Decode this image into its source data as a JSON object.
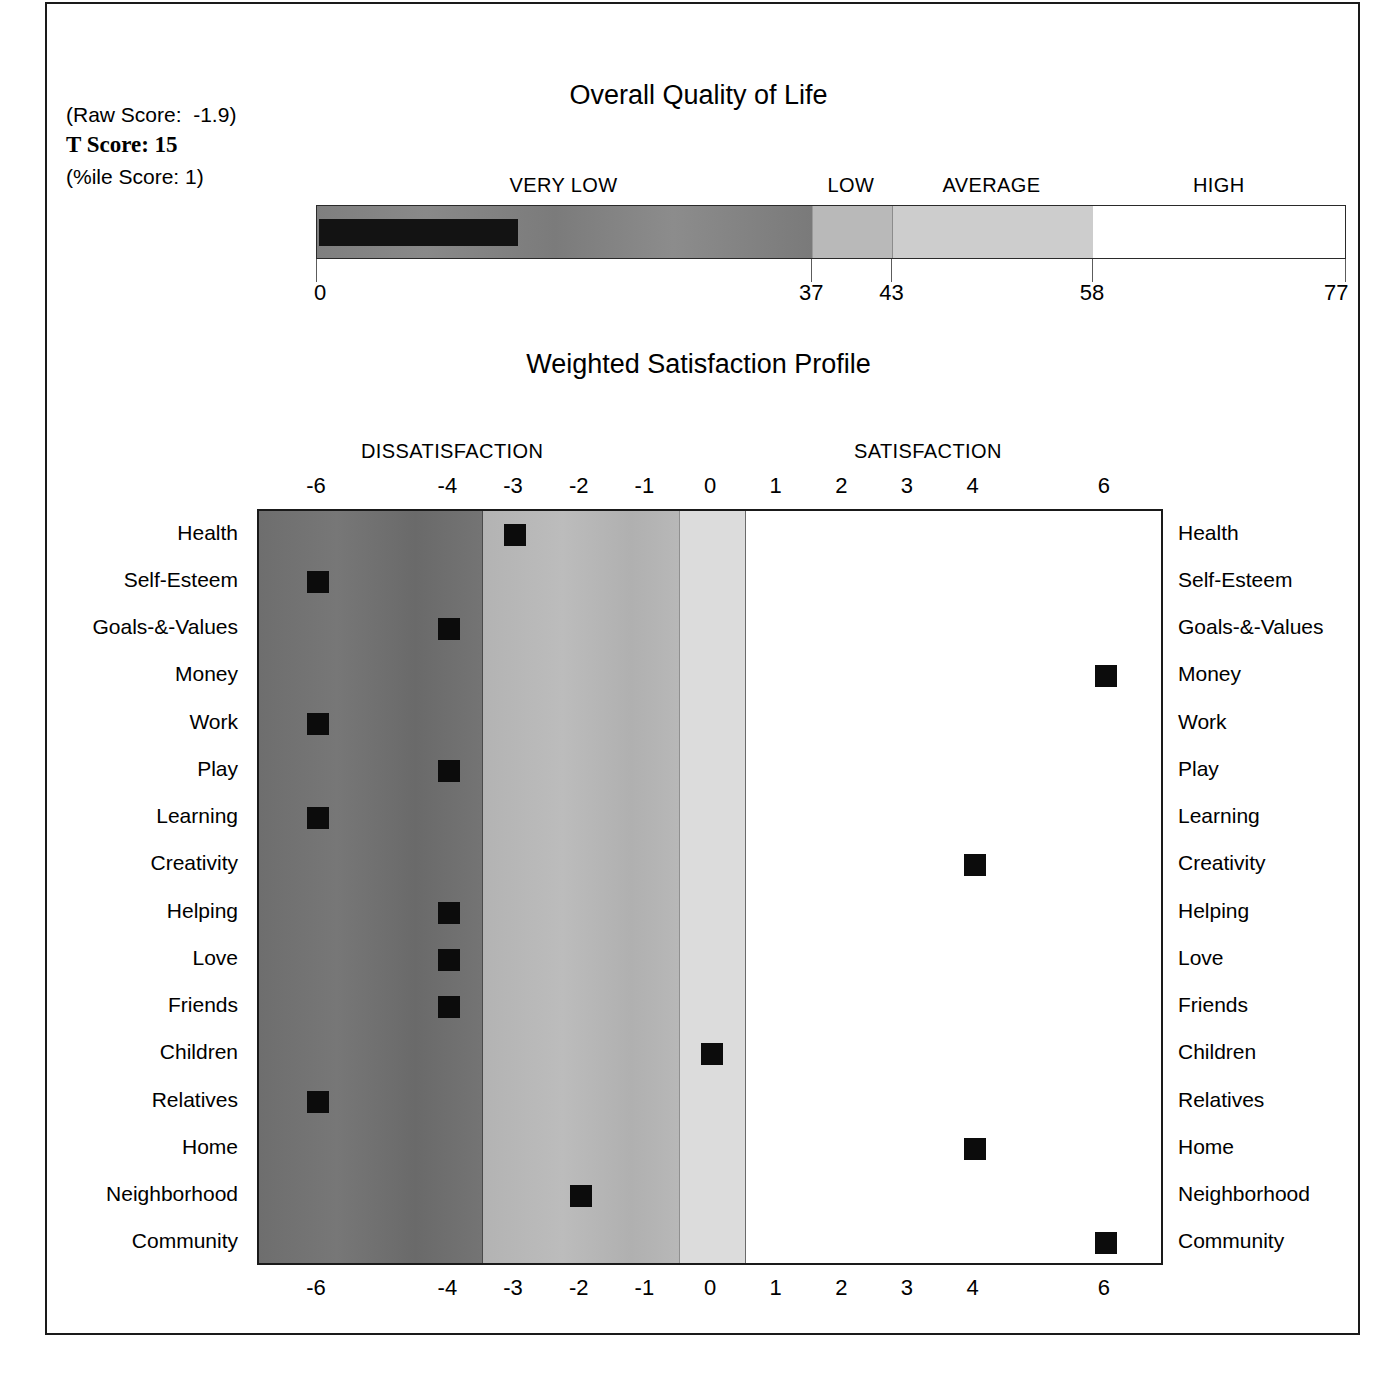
{
  "report": {
    "scores": {
      "raw_score_label": "(Raw Score:  -1.9)",
      "t_score_label": "T Score: 15",
      "percentile_label": "(%ile Score: 1)"
    },
    "overall_quality_of_life": {
      "title": "Overall Quality of Life",
      "categories": [
        {
          "label": "VERY LOW",
          "start": 0,
          "end": 37
        },
        {
          "label": "LOW",
          "start": 37,
          "end": 43
        },
        {
          "label": "AVERAGE",
          "start": 43,
          "end": 58
        },
        {
          "label": "HIGH",
          "start": 58,
          "end": 77
        }
      ],
      "tick_labels": [
        "0",
        "37",
        "43",
        "58",
        "77"
      ],
      "tick_values": [
        0,
        37,
        43,
        58,
        77
      ],
      "axis_min": 0,
      "axis_max": 77,
      "marker_value": 15,
      "marker_color": "#131313"
    },
    "weighted_satisfaction_profile": {
      "title": "Weighted Satisfaction Profile",
      "heading_left": "DISSATISFACTION",
      "heading_right": "SATISFACTION"
    }
  },
  "chart_data": [
    {
      "type": "bar",
      "title": "Overall Quality of Life",
      "xlabel": "",
      "ylabel": "",
      "xlim": [
        0,
        77
      ],
      "grid": false,
      "legend": null,
      "categories": [
        "VERY LOW",
        "LOW",
        "AVERAGE",
        "HIGH"
      ],
      "band_ranges": [
        [
          0,
          37
        ],
        [
          37,
          43
        ],
        [
          43,
          58
        ],
        [
          58,
          77
        ]
      ],
      "band_colors": [
        "#7f7f7f",
        "#b9b9b9",
        "#cdcdcd",
        "#ffffff"
      ],
      "tick_labels": [
        "0",
        "37",
        "43",
        "58",
        "77"
      ],
      "values": [
        15
      ],
      "annotations": [
        "(Raw Score:  -1.9)",
        "T Score: 15",
        "(%ile Score: 1)"
      ]
    },
    {
      "type": "scatter",
      "title": "Weighted Satisfaction Profile",
      "xlabel": "",
      "ylabel": "",
      "xlim": [
        -6.9,
        6.9
      ],
      "grid": false,
      "legend": null,
      "tick_labels": [
        "-6",
        "-4",
        "-3",
        "-2",
        "-1",
        "0",
        "1",
        "2",
        "3",
        "4",
        "6"
      ],
      "tick_values": [
        -6,
        -4,
        -3,
        -2,
        -1,
        0,
        1,
        2,
        3,
        4,
        6
      ],
      "zone_labels": [
        "DISSATISFACTION",
        "SATISFACTION"
      ],
      "band_ranges": [
        [
          -6.9,
          -3.5
        ],
        [
          -3.5,
          -0.5
        ],
        [
          -0.5,
          0.5
        ],
        [
          0.5,
          6.9
        ]
      ],
      "band_colors": [
        "#6e6e6e",
        "#b3b3b3",
        "#dcdcdc",
        "#ffffff"
      ],
      "categories": [
        "Health",
        "Self-Esteem",
        "Goals-&-Values",
        "Money",
        "Work",
        "Play",
        "Learning",
        "Creativity",
        "Helping",
        "Love",
        "Friends",
        "Children",
        "Relatives",
        "Home",
        "Neighborhood",
        "Community"
      ],
      "values": [
        -3,
        -6,
        -4,
        6,
        -6,
        -4,
        -6,
        4,
        -4,
        -4,
        -4,
        0,
        -6,
        4,
        -2,
        6
      ]
    }
  ]
}
